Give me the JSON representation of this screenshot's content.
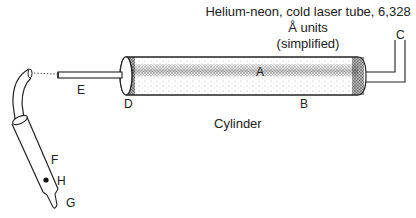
{
  "diagram": {
    "title_line1": "Helium-neon, cold laser tube, 6,328 Å units",
    "title_line2": "(simplified)",
    "caption": "Cylinder",
    "labels": {
      "A": "A",
      "B": "B",
      "C": "C",
      "D": "D",
      "E": "E",
      "F": "F",
      "G": "G",
      "H": "H"
    },
    "components": [
      {
        "id": "laser-tube",
        "name": "Cylinder (laser tube body)"
      },
      {
        "id": "end-cap-left",
        "label": "D"
      },
      {
        "id": "end-cap-right"
      },
      {
        "id": "wire-right",
        "label": "C"
      },
      {
        "id": "rod-left",
        "label": "E"
      },
      {
        "id": "handpiece",
        "labels": [
          "F",
          "H",
          "G"
        ]
      }
    ],
    "colors": {
      "line": "#222222",
      "stipple": "#555555"
    }
  }
}
